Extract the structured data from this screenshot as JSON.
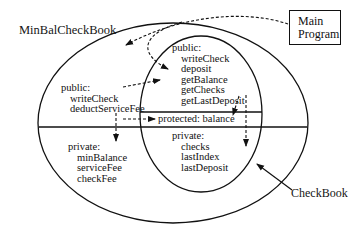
{
  "diagram": {
    "outer_class": {
      "label": "MinBalCheckBook"
    },
    "inner_class": {
      "label": "CheckBook"
    },
    "main_program": {
      "line1": "Main",
      "line2": "Program"
    },
    "outer_public": {
      "header": "public:",
      "items": [
        "writeCheck",
        "deductServiceFee"
      ]
    },
    "outer_private": {
      "header": "private:",
      "items": [
        "minBalance",
        "serviceFee",
        "checkFee"
      ]
    },
    "inner_public": {
      "header": "public:",
      "items": [
        "writeCheck",
        "deposit",
        "getBalance",
        "getChecks",
        "getLastDeposit"
      ]
    },
    "inner_protected": {
      "label": "protected:  balance"
    },
    "inner_private": {
      "header": "private:",
      "items": [
        "checks",
        "lastIndex",
        "lastDeposit"
      ]
    },
    "colors": {
      "line": "#111111",
      "background": "#ffffff"
    }
  }
}
